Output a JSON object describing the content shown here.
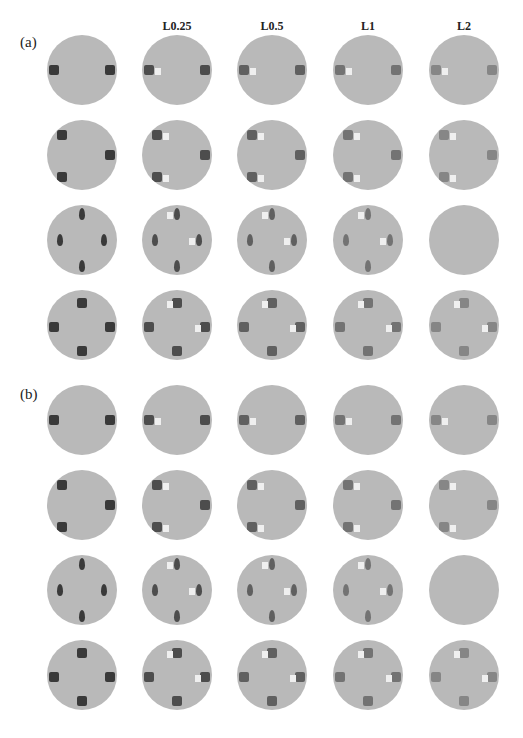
{
  "panels": [
    {
      "label": "(a)",
      "top": 40
    },
    {
      "label": "(b)",
      "top": 390
    }
  ],
  "columns": [
    "",
    "L0.25",
    "L0.5",
    "L1",
    "L2"
  ],
  "column_centers_x": [
    82,
    177,
    272,
    368,
    464
  ],
  "row_centers_y": {
    "a": [
      70,
      155,
      240,
      325
    ],
    "b": [
      420,
      505,
      590,
      675
    ]
  },
  "colors": {
    "disk": "#b9b9b9",
    "inclusion_dark": "#3a3a3a",
    "artifact_light": "#efefef",
    "background": "#ffffff"
  },
  "rows": [
    {
      "name": "two-inclusions",
      "ground_truth": [
        [
          -28,
          0
        ],
        [
          28,
          0
        ]
      ]
    },
    {
      "name": "three-inclusions",
      "ground_truth": [
        [
          -20,
          -20
        ],
        [
          28,
          0
        ],
        [
          -20,
          22
        ]
      ]
    },
    {
      "name": "four-small-inclusions",
      "ground_truth": [
        [
          0,
          -26
        ],
        [
          -22,
          0
        ],
        [
          22,
          0
        ],
        [
          0,
          26
        ]
      ]
    },
    {
      "name": "four-large-inclusions",
      "ground_truth": [
        [
          0,
          -22
        ],
        [
          -28,
          2
        ],
        [
          28,
          2
        ],
        [
          0,
          26
        ]
      ]
    }
  ]
}
